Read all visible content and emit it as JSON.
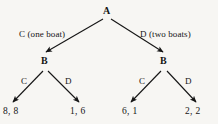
{
  "figure": {
    "type": "game-tree",
    "background_color": "#f7f6f3",
    "line_color": "#151515",
    "text_color": "#151515"
  },
  "nodes": {
    "root": {
      "label": "A",
      "x": 107,
      "y": 13
    },
    "left_inner": {
      "label": "B",
      "x": 45,
      "y": 63
    },
    "right_inner": {
      "label": "B",
      "x": 164,
      "y": 63
    }
  },
  "edges": {
    "root_left": {
      "label": "C (one boat)",
      "x": 19,
      "y": 37
    },
    "root_right": {
      "label": "D (two boats)",
      "x": 140,
      "y": 37
    },
    "left_inner_left": {
      "label": "C",
      "x": 23,
      "y": 84
    },
    "left_inner_right": {
      "label": "D",
      "x": 66,
      "y": 84
    },
    "right_inner_left": {
      "label": "C",
      "x": 141,
      "y": 84
    },
    "right_inner_right": {
      "label": "D",
      "x": 186,
      "y": 84
    }
  },
  "payoffs": [
    {
      "name": "payoff-cc",
      "label": "8, 8",
      "x": 3,
      "y": 114
    },
    {
      "name": "payoff-cd",
      "label": "1, 6",
      "x": 70,
      "y": 114
    },
    {
      "name": "payoff-dc",
      "label": "6, 1",
      "x": 122,
      "y": 114
    },
    {
      "name": "payoff-dd",
      "label": "2, 2",
      "x": 185,
      "y": 114
    }
  ]
}
